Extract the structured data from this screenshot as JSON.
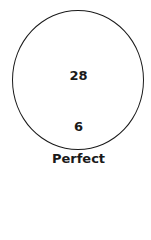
{
  "diagram": {
    "shape": "circle",
    "top_value": "28",
    "bottom_value": "6",
    "caption": "Perfect",
    "stroke_color": "#1a1a1a"
  }
}
